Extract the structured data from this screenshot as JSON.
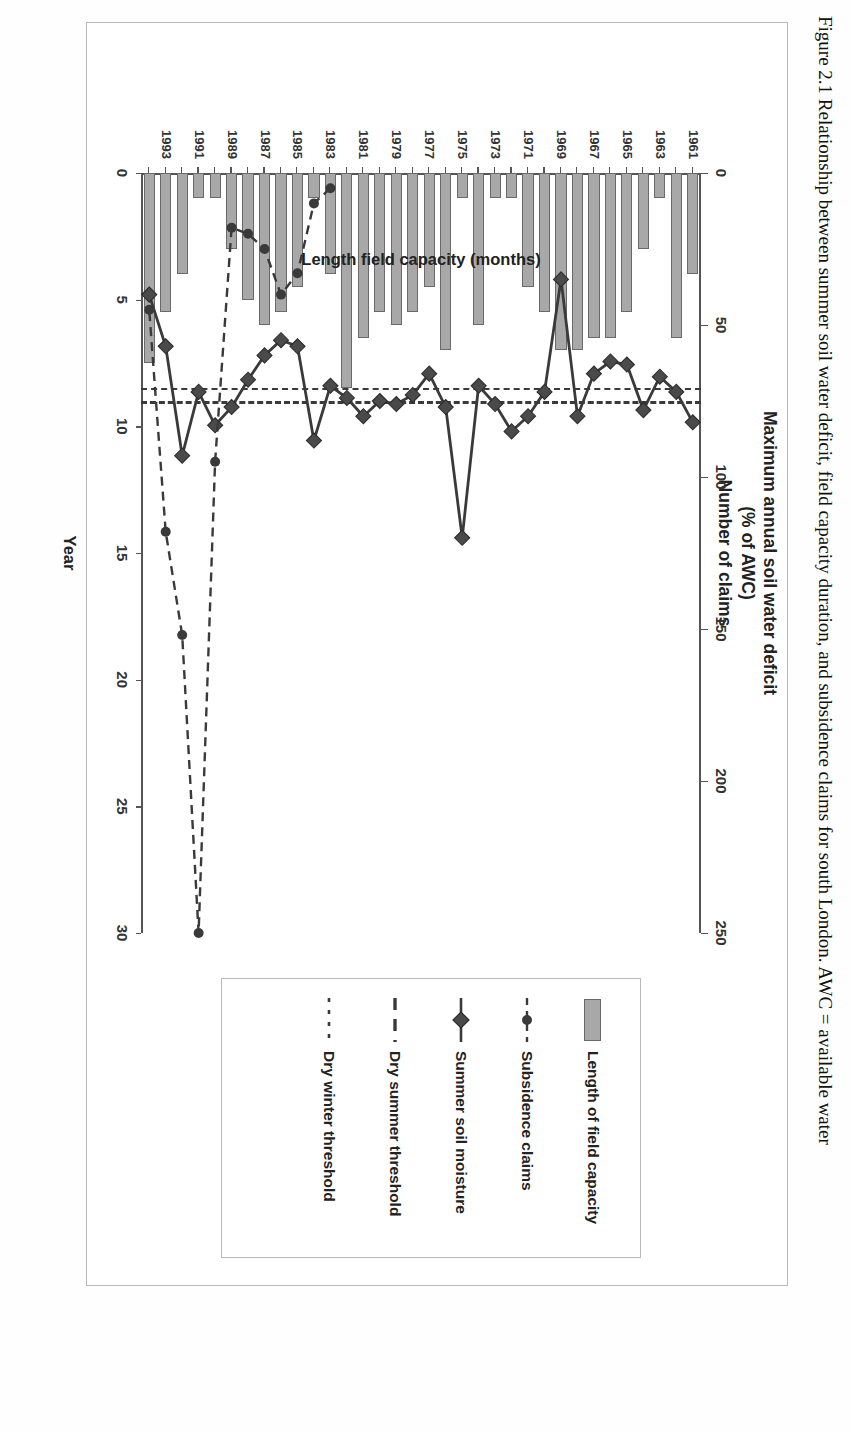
{
  "figure": {
    "top_title_lines": [
      "Maximum annual soil water deficit",
      "(% of AWC)",
      "Number of claims"
    ],
    "x_axis_label": "Year",
    "left_axis_label": "Length field capacity (months)",
    "caption": "Figure 2.1  Relationship between summer soil water deficit, field capacity duration, and subsidence claims for south London. AWC = available water"
  },
  "axes": {
    "top": {
      "label": "Maximum annual soil water deficit (% of AWC) / Number of claims",
      "ticks": [
        "250",
        "200",
        "150",
        "100",
        "50",
        "0"
      ],
      "min": 0,
      "max": 250
    },
    "left": {
      "label": "Length field capacity (months)",
      "ticks": [
        "30",
        "25",
        "20",
        "15",
        "10",
        "5",
        "0"
      ],
      "min": 0,
      "max": 30
    },
    "years": [
      "1961",
      "1962",
      "1963",
      "1964",
      "1965",
      "1966",
      "1967",
      "1968",
      "1969",
      "1970",
      "1971",
      "1972",
      "1973",
      "1974",
      "1975",
      "1976",
      "1977",
      "1978",
      "1979",
      "1980",
      "1981",
      "1982",
      "1983",
      "1984",
      "1985",
      "1986",
      "1987",
      "1988",
      "1989",
      "1990",
      "1991",
      "1992",
      "1993",
      "1994"
    ],
    "year_tick_labels": [
      "1961",
      "1963",
      "1965",
      "1967",
      "1969",
      "1971",
      "1973",
      "1975",
      "1977",
      "1979",
      "1981",
      "1983",
      "1985",
      "1987",
      "1989",
      "1991",
      "1993"
    ]
  },
  "legend": {
    "items": [
      {
        "label": "Length of field capacity",
        "key": "filled-bar-swatch"
      },
      {
        "label": "Subsidence claims",
        "key": "circle-marker-line"
      },
      {
        "label": "Summer soil moisture",
        "key": "diamond-marker-line"
      },
      {
        "label": "Dry summer threshold",
        "key": "long-dashed-line"
      },
      {
        "label": "Dry winter threshold",
        "key": "short-dashed-line"
      }
    ]
  },
  "colors": {
    "bar_fill": "#a8a8a8",
    "bar_edge": "#6a6a6a",
    "line": "#3a3a3a",
    "axis": "#555555",
    "text": "#222222"
  },
  "chart_data": {
    "type": "bar",
    "xlabel": "Year",
    "ylabel": "Length field capacity (months)",
    "y2label": "Maximum annual soil water deficit (% of AWC) / Number of claims",
    "ylim": [
      0,
      30
    ],
    "y2lim": [
      0,
      250
    ],
    "grid": false,
    "legend_position": "right",
    "categories": [
      "1961",
      "1962",
      "1963",
      "1964",
      "1965",
      "1966",
      "1967",
      "1968",
      "1969",
      "1970",
      "1971",
      "1972",
      "1973",
      "1974",
      "1975",
      "1976",
      "1977",
      "1978",
      "1979",
      "1980",
      "1981",
      "1982",
      "1983",
      "1984",
      "1985",
      "1986",
      "1987",
      "1988",
      "1989",
      "1990",
      "1991",
      "1992",
      "1993",
      "1994"
    ],
    "series": [
      {
        "name": "Length of field capacity",
        "type": "bar",
        "axis": "left",
        "unit": "months",
        "values": [
          4.0,
          6.5,
          1.0,
          3.0,
          5.5,
          6.5,
          6.5,
          7.0,
          7.0,
          5.5,
          4.5,
          1.0,
          1.0,
          6.0,
          1.0,
          7.0,
          4.5,
          5.5,
          6.0,
          5.5,
          6.5,
          8.5,
          4.0,
          1.0,
          4.5,
          5.5,
          6.0,
          5.0,
          3.0,
          1.0,
          1.0,
          4.0,
          5.5,
          7.5
        ]
      },
      {
        "name": "Summer soil moisture",
        "type": "line-diamond",
        "axis": "top",
        "unit": "% of AWC",
        "values": [
          82,
          72,
          67,
          78,
          63,
          62,
          66,
          80,
          35,
          72,
          80,
          85,
          76,
          70,
          120,
          77,
          66,
          73,
          76,
          75,
          80,
          74,
          70,
          88,
          57,
          55,
          60,
          68,
          77,
          83,
          72,
          93,
          57,
          40
        ]
      },
      {
        "name": "Subsidence claims",
        "type": "line-circle-dotted",
        "axis": "top",
        "unit": "claims",
        "values": [
          null,
          null,
          null,
          null,
          null,
          null,
          null,
          null,
          null,
          null,
          null,
          null,
          null,
          null,
          null,
          null,
          null,
          null,
          null,
          null,
          null,
          null,
          5,
          10,
          33,
          40,
          25,
          20,
          18,
          95,
          250,
          152,
          118,
          45
        ]
      }
    ],
    "reference_lines": [
      {
        "name": "Dry summer threshold",
        "axis": "top",
        "value": 75,
        "style": "long-dashed"
      },
      {
        "name": "Dry winter threshold",
        "axis": "left",
        "value": 8.5,
        "style": "short-dashed"
      }
    ]
  }
}
